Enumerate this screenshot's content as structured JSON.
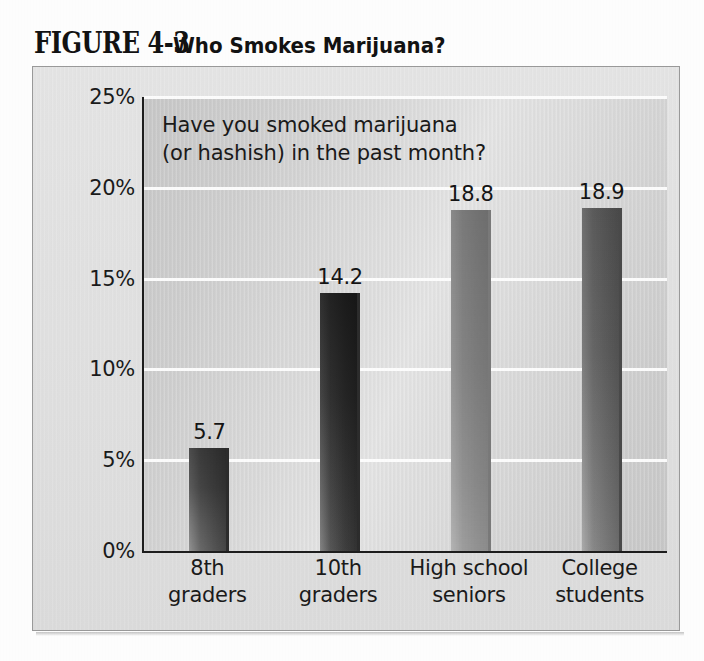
{
  "figure": {
    "label": "FIGURE 4-3",
    "caption": "Who Smokes Marijuana?"
  },
  "chart_data": {
    "type": "bar",
    "title": "Who Smokes Marijuana?",
    "annotation": "Have you smoked marijuana\n(or hashish) in the past month?",
    "categories": [
      "8th\ngraders",
      "10th\ngraders",
      "High school\nseniors",
      "College\nstudents"
    ],
    "values": [
      5.7,
      14.2,
      18.8,
      18.9
    ],
    "value_labels": [
      "5.7",
      "14.2",
      "18.8",
      "18.9"
    ],
    "xlabel": "",
    "ylabel": "",
    "ylim": [
      0,
      25
    ],
    "ytick_values": [
      25,
      20,
      15,
      10,
      5,
      0
    ],
    "ytick_labels": [
      "25%",
      "20%",
      "15%",
      "10%",
      "5%",
      "0%"
    ],
    "grid": true,
    "gridline_color": "#ffffff",
    "legend": null,
    "bar_colors": [
      "#585858",
      "#414141",
      "#939393",
      "#7a7a7a"
    ],
    "plot_background": "#d8d8d8",
    "axis_color": "#1d1d1d"
  }
}
